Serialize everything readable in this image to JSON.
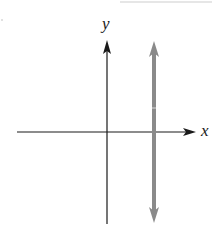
{
  "diagram": {
    "type": "coordinate-plane",
    "axes": {
      "x_label": "x",
      "y_label": "y",
      "color": "#1a1a1a"
    },
    "vertical_line": {
      "position": "right of y-axis (x = a, a > 0)",
      "color": "#8a8a8a",
      "arrows": "both ends"
    }
  }
}
